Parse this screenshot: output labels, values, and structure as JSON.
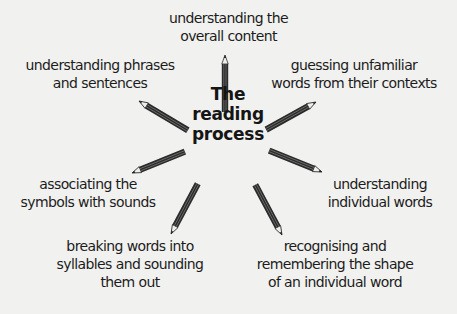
{
  "diagram": {
    "type": "spider",
    "center": {
      "lines": [
        "The",
        "reading",
        "process"
      ]
    },
    "spokes": [
      {
        "id": "top",
        "lines": [
          "understanding the",
          "overall content"
        ]
      },
      {
        "id": "upper-right",
        "lines": [
          "guessing unfamiliar",
          "words from their contexts"
        ]
      },
      {
        "id": "right",
        "lines": [
          "understanding",
          "individual words"
        ]
      },
      {
        "id": "lower-right",
        "lines": [
          "recognising and",
          "remembering the shape",
          "of an individual word"
        ]
      },
      {
        "id": "lower-left",
        "lines": [
          "breaking words into",
          "syllables and sounding",
          "them out"
        ]
      },
      {
        "id": "left",
        "lines": [
          "associating the",
          "symbols with sounds"
        ]
      },
      {
        "id": "upper-left",
        "lines": [
          "understanding phrases",
          "and sentences"
        ]
      }
    ],
    "connector_icon": "pencil-icon",
    "colors": {
      "background": "#f1f1ef",
      "text": "#1c1c1c",
      "pencil": "#2a2a2a"
    }
  }
}
